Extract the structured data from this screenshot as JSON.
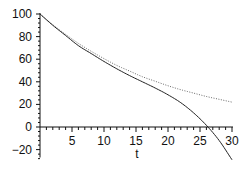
{
  "chart_data": {
    "type": "line",
    "title": "",
    "xlabel": "t",
    "ylabel": "",
    "xlim": [
      0,
      30
    ],
    "ylim": [
      -30,
      100
    ],
    "grid": false,
    "legend": null,
    "x_ticks": [
      5,
      10,
      15,
      20,
      25,
      30
    ],
    "x_tick_labels": [
      "5",
      "10",
      "15",
      "20",
      "25",
      "30"
    ],
    "y_ticks": [
      100,
      80,
      60,
      40,
      20,
      0,
      -20
    ],
    "y_tick_labels": [
      "100",
      "80",
      "60",
      "40",
      "20",
      "0",
      "−20"
    ],
    "series": [
      {
        "name": "solid",
        "style": "solid",
        "color": "#222222",
        "x": [
          0,
          2,
          4,
          6,
          8,
          10,
          12,
          14,
          16,
          18,
          20,
          22,
          24,
          26,
          28,
          30
        ],
        "values": [
          100,
          90,
          81,
          72,
          65,
          58,
          51.5,
          45.5,
          40,
          34.5,
          28.5,
          21.5,
          12.5,
          1.5,
          -12,
          -29
        ]
      },
      {
        "name": "dotted",
        "style": "dotted",
        "color": "#555555",
        "x": [
          0,
          2,
          4,
          6,
          8,
          10,
          12,
          14,
          16,
          18,
          20,
          22,
          24,
          26,
          28,
          30
        ],
        "values": [
          100,
          90.5,
          82,
          74,
          67,
          60.5,
          54.5,
          49.5,
          44.5,
          40.5,
          36.5,
          33,
          30,
          27,
          24.5,
          22
        ]
      }
    ]
  },
  "plot": {
    "x_axis_label": "t"
  }
}
